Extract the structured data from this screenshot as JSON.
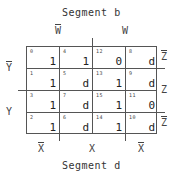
{
  "title_top": "Segment b",
  "title_bottom": "Segment d",
  "labels": {
    "w_bar": "W",
    "w": "W",
    "y_bar": "Y",
    "y": "Y",
    "z_bar_top": "Z",
    "z": "Z",
    "z_bar_bottom": "Z",
    "x_bar_left": "X",
    "x": "X",
    "x_bar_right": "X"
  },
  "kmap": {
    "rows": [
      [
        {
          "index": "0",
          "value": "1"
        },
        {
          "index": "4",
          "value": "1"
        },
        {
          "index": "12",
          "value": "0"
        },
        {
          "index": "8",
          "value": "d"
        }
      ],
      [
        {
          "index": "1",
          "value": "1"
        },
        {
          "index": "5",
          "value": "d"
        },
        {
          "index": "13",
          "value": "1"
        },
        {
          "index": "9",
          "value": "d"
        }
      ],
      [
        {
          "index": "3",
          "value": "1"
        },
        {
          "index": "7",
          "value": "d"
        },
        {
          "index": "15",
          "value": "1"
        },
        {
          "index": "11",
          "value": "0"
        }
      ],
      [
        {
          "index": "2",
          "value": "1"
        },
        {
          "index": "6",
          "value": "d"
        },
        {
          "index": "14",
          "value": "1"
        },
        {
          "index": "10",
          "value": "d"
        }
      ]
    ]
  }
}
